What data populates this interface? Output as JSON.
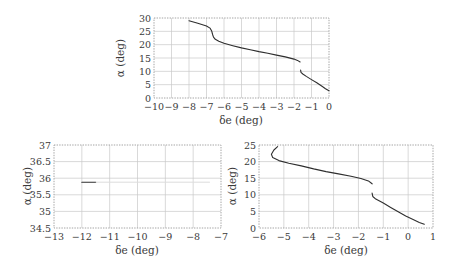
{
  "chart_data": [
    {
      "id": "top",
      "type": "line",
      "title": "",
      "xlabel": "δe (deg)",
      "ylabel": "α (deg)",
      "xlim": [
        -10,
        0
      ],
      "ylim": [
        0,
        30
      ],
      "xticks": [
        "−10",
        "−9",
        "−8",
        "−7",
        "−6",
        "−5",
        "−4",
        "−3",
        "−2",
        "−1",
        "0"
      ],
      "yticks": [
        "0",
        "5",
        "10",
        "15",
        "20",
        "25",
        "30"
      ],
      "grid": true,
      "legend": null,
      "series": [
        {
          "name": "upper branch",
          "x": [
            -8.0,
            -7.5,
            -7.0,
            -6.8,
            -6.7,
            -6.65,
            -6.6,
            -6.5,
            -6.3,
            -6.0,
            -5.5,
            -5.0,
            -4.5,
            -4.0,
            -3.5,
            -3.0,
            -2.5,
            -2.0,
            -1.8,
            -1.65
          ],
          "y": [
            29.0,
            28.0,
            27.0,
            26.2,
            25.0,
            23.8,
            22.8,
            22.0,
            21.3,
            20.5,
            19.6,
            18.8,
            18.1,
            17.4,
            16.8,
            16.1,
            15.4,
            14.6,
            14.1,
            13.5
          ]
        },
        {
          "name": "lower branch",
          "x": [
            -1.62,
            -1.6,
            -1.5,
            -1.3,
            -1.0,
            -0.7,
            -0.4,
            -0.2,
            0.0
          ],
          "y": [
            10.5,
            9.6,
            9.0,
            8.1,
            6.9,
            5.7,
            4.4,
            3.5,
            2.7
          ]
        }
      ]
    },
    {
      "id": "bottom-left",
      "type": "line",
      "title": "",
      "xlabel": "δe (deg)",
      "ylabel": "α (deg)",
      "xlim": [
        -13,
        -7
      ],
      "ylim": [
        34.5,
        37
      ],
      "xticks": [
        "−13",
        "−12",
        "−11",
        "−10",
        "−9",
        "−8",
        "−7"
      ],
      "yticks": [
        "34.5",
        "35",
        "35.5",
        "36",
        "36.5",
        "37"
      ],
      "grid": true,
      "legend": null,
      "series": [
        {
          "name": "segment",
          "x": [
            -12.0,
            -11.5
          ],
          "y": [
            35.88,
            35.88
          ]
        },
        {
          "name": "faint continuation",
          "x": [
            -11.5,
            -7.4
          ],
          "y": [
            35.88,
            35.88
          ]
        }
      ]
    },
    {
      "id": "bottom-right",
      "type": "line",
      "title": "",
      "xlabel": "δe (deg)",
      "ylabel": "α (deg)",
      "xlim": [
        -6,
        1
      ],
      "ylim": [
        0,
        25
      ],
      "xticks": [
        "−6",
        "−5",
        "−4",
        "−3",
        "−2",
        "−1",
        "0",
        "1"
      ],
      "yticks": [
        "0",
        "5",
        "10",
        "15",
        "20",
        "25"
      ],
      "grid": true,
      "legend": null,
      "series": [
        {
          "name": "upper branch",
          "x": [
            -5.25,
            -5.4,
            -5.5,
            -5.45,
            -5.2,
            -4.8,
            -4.3,
            -3.8,
            -3.3,
            -2.8,
            -2.3,
            -1.9,
            -1.6,
            -1.45
          ],
          "y": [
            24.5,
            23.5,
            22.2,
            21.2,
            20.3,
            19.5,
            18.7,
            17.8,
            17.0,
            16.3,
            15.6,
            14.9,
            14.2,
            13.3
          ]
        },
        {
          "name": "lower branch",
          "x": [
            -1.45,
            -1.42,
            -1.3,
            -1.0,
            -0.7,
            -0.4,
            -0.1,
            0.2,
            0.45,
            0.65
          ],
          "y": [
            10.5,
            9.5,
            8.7,
            7.5,
            6.2,
            4.9,
            3.6,
            2.6,
            1.7,
            1.1
          ]
        }
      ]
    }
  ],
  "panels": {
    "top": {
      "xlabel": "δe (deg)",
      "ylabel": "α (deg)"
    },
    "bottom_left": {
      "xlabel": "δe (deg)",
      "ylabel": "α (deg)"
    },
    "bottom_right": {
      "xlabel": "δe (deg)",
      "ylabel": "α (deg)"
    }
  }
}
